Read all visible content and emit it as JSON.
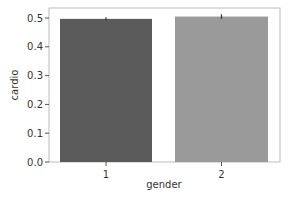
{
  "chart_data": {
    "type": "bar",
    "title": "",
    "xlabel": "gender",
    "ylabel": "cardio",
    "categories": [
      "1",
      "2"
    ],
    "values": [
      0.497,
      0.505
    ],
    "error_bars": [
      [
        0.491,
        0.503
      ],
      [
        0.497,
        0.513
      ]
    ],
    "colors": [
      "#5a5a5a",
      "#9a9a9a"
    ],
    "ylim": [
      0.0,
      0.53
    ],
    "yticks": [
      0.0,
      0.1,
      0.2,
      0.3,
      0.4,
      0.5
    ],
    "ytick_labels": [
      "0.0",
      "0.1",
      "0.2",
      "0.3",
      "0.4",
      "0.5"
    ],
    "grid": false,
    "legend": null
  }
}
